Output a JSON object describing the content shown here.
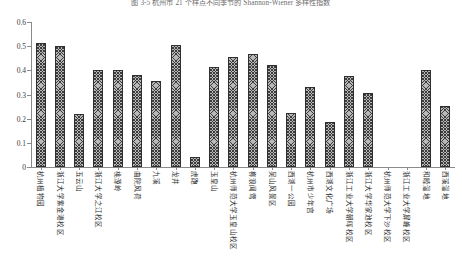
{
  "figure": {
    "caption": "图 3-5  杭州市 21 个样点不同季节的 Shannon-Wiener 多样性指数",
    "background": "#ffffff",
    "bar_fill": "#b8b8b8",
    "bar_edge": "#2f2f2f",
    "axis_color": "#8a8a8a"
  },
  "chart_data": {
    "type": "bar",
    "title": "图 3-5  杭州市 21 个样点不同季节的 Shannon-Wiener 多样性指数",
    "xlabel": "",
    "ylabel": "",
    "ylim": [
      0,
      0.6
    ],
    "grid": false,
    "legend": null,
    "ytick_labels": [
      "0",
      "0.1",
      "0.2",
      "0.3",
      "0.4",
      "0.5",
      "0.6"
    ],
    "ytick_values": [
      0,
      0.1,
      0.2,
      0.3,
      0.4,
      0.5,
      0.6
    ],
    "categories": [
      "杭州植物园",
      "浙江大学紫金港校区",
      "五云山",
      "浙江大学之江校区",
      "桃源岭",
      "曲院风荷",
      "九溪",
      "龙井",
      "虎跑",
      "玉皇山",
      "杭州师范大学玉皇山校区",
      "柳浪闻莺",
      "吴山风景区",
      "西湖一公园",
      "杭州市少年宫",
      "西湖文化广场",
      "浙江工业大学朝晖校区",
      "浙江大学华家池校区",
      "杭州师范大学下沙校区",
      "浙江工业大学屏峰校区",
      "和睦湿地",
      "西溪湿地"
    ],
    "values": [
      0.515,
      0.502,
      0.218,
      0.4,
      0.4,
      0.381,
      0.356,
      0.505,
      0.04,
      0.412,
      0.456,
      0.466,
      0.422,
      0.222,
      0.333,
      0.185,
      0.376,
      0.306,
      0.0,
      0.0,
      0.401,
      0.253
    ]
  }
}
